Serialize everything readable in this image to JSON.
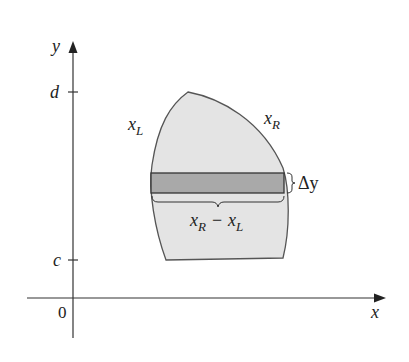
{
  "diagram": {
    "axes": {
      "x_label": "x",
      "y_label": "y",
      "origin_label": "0",
      "y_ticks": [
        {
          "label": "d",
          "y": 92
        },
        {
          "label": "c",
          "y": 260
        }
      ]
    },
    "region": {
      "fill": "#e4e4e4",
      "stroke": "#555555",
      "left_curve_label": "x",
      "left_curve_sub": "L",
      "right_curve_label": "x",
      "right_curve_sub": "R"
    },
    "strip": {
      "fill": "#a9a9a9",
      "stroke": "#333333",
      "height_label": "Δy",
      "width_label_main1": "x",
      "width_label_sub1": "R",
      "width_label_op": "−",
      "width_label_main2": "x",
      "width_label_sub2": "L"
    }
  }
}
